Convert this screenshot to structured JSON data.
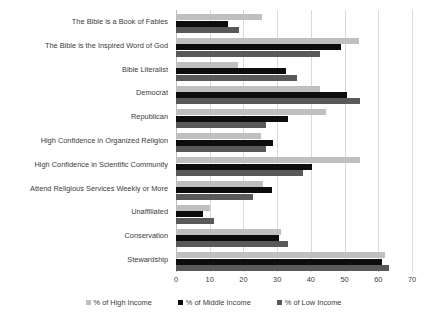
{
  "chart_data": {
    "type": "bar",
    "orientation": "horizontal",
    "title": "",
    "subtitle": "",
    "xlabel": "",
    "ylabel": "",
    "xlim": [
      0,
      70
    ],
    "xticks": [
      0,
      10,
      20,
      30,
      40,
      50,
      60,
      70
    ],
    "xtick_labels": [
      "0",
      "10",
      "20",
      "30",
      "40",
      "50",
      "60",
      "70"
    ],
    "grid": "vertical",
    "legend_position": "bottom",
    "categories": [
      "The Bible is a Book of Fables",
      "The Bible is the Inspired Word of God",
      "Bible Literalist",
      "Democrat",
      "Republican",
      "High Confidence in Organized Religion",
      "High Confidence in Scientific Community",
      "Attend Religious Services Weekly or More",
      "Unaffiliated",
      "Conservation",
      "Stewardship"
    ],
    "series": [
      {
        "name": "% of High Income",
        "color": "#bfbfbf",
        "values": [
          25.5,
          54.3,
          18.5,
          42.7,
          44.5,
          25.2,
          54.6,
          25.8,
          10.1,
          31.1,
          62.0
        ]
      },
      {
        "name": "% of Middle Income",
        "color": "#0d0d0d",
        "values": [
          15.4,
          48.9,
          32.5,
          50.7,
          33.2,
          28.8,
          40.4,
          28.5,
          8.0,
          30.6,
          61.1
        ]
      },
      {
        "name": "% of Low Income",
        "color": "#595959",
        "values": [
          18.7,
          42.7,
          35.8,
          54.6,
          26.7,
          26.7,
          37.7,
          22.8,
          11.3,
          33.2,
          63.2
        ]
      }
    ]
  },
  "legend": {
    "items": [
      {
        "label": "% of High Income",
        "key": "high"
      },
      {
        "label": "% of Middle Income",
        "key": "middle"
      },
      {
        "label": "% of Low Income",
        "key": "low"
      }
    ]
  }
}
